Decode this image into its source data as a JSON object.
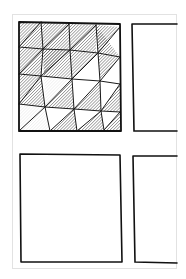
{
  "artwork": {
    "type": "hand-drawn sketch",
    "panels": [
      {
        "id": "top-left",
        "content": "hatched triangle grid",
        "grid_rows": 4,
        "grid_cols": 4
      },
      {
        "id": "top-right",
        "content": "empty"
      },
      {
        "id": "bottom-left",
        "content": "empty"
      },
      {
        "id": "bottom-right",
        "content": "empty"
      }
    ],
    "colors": {
      "ink": "#1a1a1a",
      "paper": "#ffffff",
      "paper_edge": "#e2e2e2",
      "hatch": "#555555"
    }
  }
}
